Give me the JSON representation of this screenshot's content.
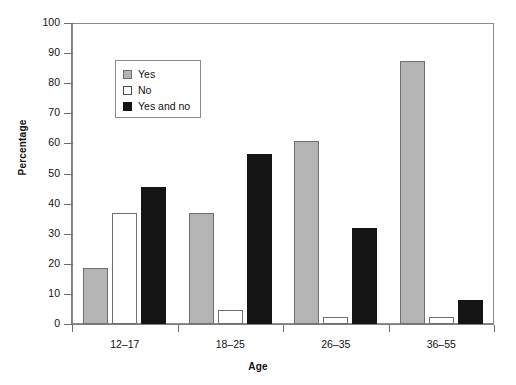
{
  "chart_data": {
    "type": "bar",
    "title": "",
    "xlabel": "Age",
    "ylabel": "Percentage",
    "categories": [
      "12–17",
      "18–25",
      "26–35",
      "36–55"
    ],
    "series": [
      {
        "name": "Yes",
        "color": "#b4b4b4",
        "values": [
          18.5,
          36.8,
          60.8,
          87.5
        ]
      },
      {
        "name": "No",
        "color": "#ffffff",
        "values": [
          37.0,
          4.6,
          2.3,
          2.4
        ]
      },
      {
        "name": "Yes and no",
        "color": "#141414",
        "values": [
          45.5,
          56.5,
          31.8,
          8.0
        ]
      }
    ],
    "ylim": [
      0,
      100
    ],
    "ytick_values": [
      0,
      10,
      20,
      30,
      40,
      50,
      60,
      70,
      80,
      90,
      100
    ],
    "ytick_labels": [
      "0",
      "10",
      "20",
      "30",
      "40",
      "50",
      "60",
      "70",
      "80",
      "90",
      "100"
    ],
    "grid": false,
    "legend_position": "upper-left-inside",
    "legend_entries": [
      "Yes",
      "No",
      "Yes and no"
    ]
  }
}
